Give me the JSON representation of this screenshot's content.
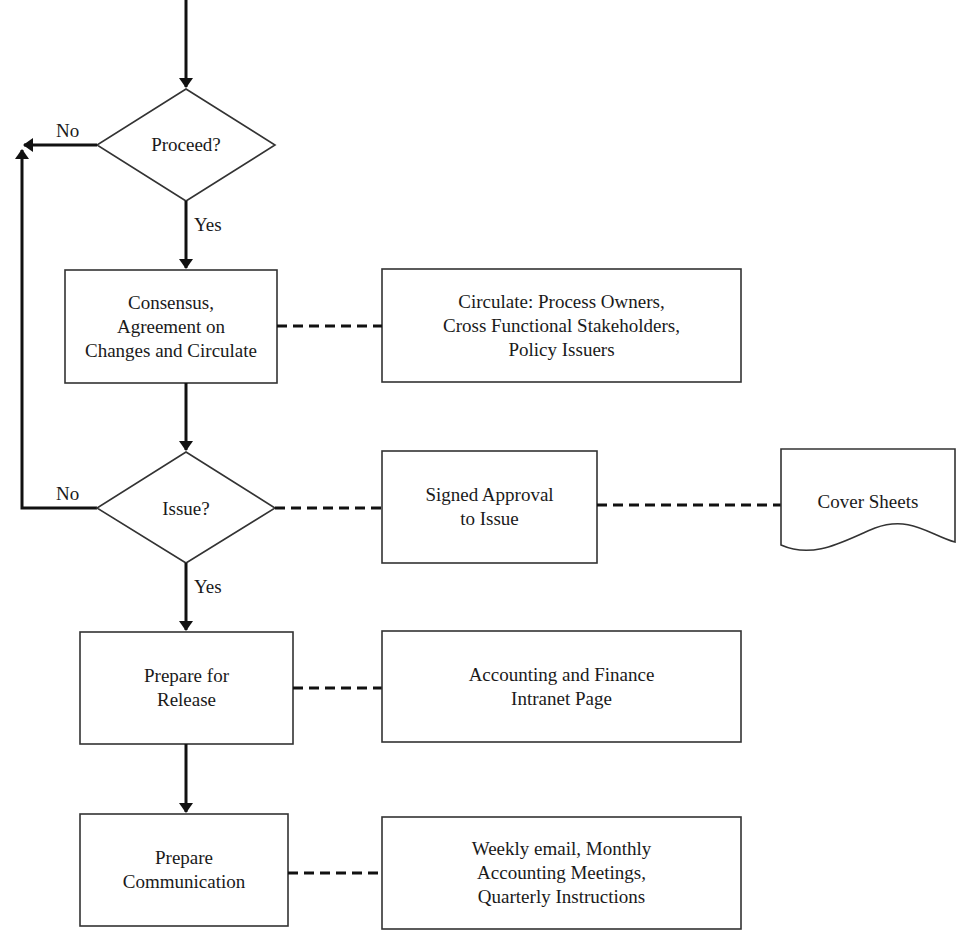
{
  "diagram": {
    "type": "flowchart",
    "nodes": [
      {
        "id": "proceed",
        "shape": "diamond",
        "label": "Proceed?"
      },
      {
        "id": "consensus",
        "shape": "process",
        "label": "Consensus,\nAgreement on\nChanges and Circulate"
      },
      {
        "id": "circulate",
        "shape": "process",
        "label": "Circulate: Process Owners,\nCross Functional Stakeholders,\nPolicy Issuers"
      },
      {
        "id": "issue",
        "shape": "diamond",
        "label": "Issue?"
      },
      {
        "id": "signed_approval",
        "shape": "process",
        "label": "Signed Approval\nto Issue"
      },
      {
        "id": "cover_sheets",
        "shape": "document",
        "label": "Cover Sheets"
      },
      {
        "id": "prepare_release",
        "shape": "process",
        "label": "Prepare for\nRelease"
      },
      {
        "id": "accounting_page",
        "shape": "process",
        "label": "Accounting and Finance\nIntranet Page"
      },
      {
        "id": "prepare_communication",
        "shape": "process",
        "label": "Prepare\nCommunication"
      },
      {
        "id": "weekly_email",
        "shape": "process",
        "label": "Weekly email, Monthly\nAccounting Meetings,\nQuarterly Instructions"
      }
    ],
    "edges": [
      {
        "from": "incoming",
        "to": "proceed",
        "style": "solid-arrow"
      },
      {
        "from": "proceed",
        "to": "consensus",
        "label": "Yes",
        "style": "solid-arrow"
      },
      {
        "from": "proceed",
        "to": "loop-left",
        "label": "No",
        "style": "solid-arrow"
      },
      {
        "from": "consensus",
        "to": "circulate",
        "style": "dashed"
      },
      {
        "from": "consensus",
        "to": "issue",
        "style": "solid-arrow"
      },
      {
        "from": "issue",
        "to": "loop-left",
        "label": "No",
        "style": "solid-arrow"
      },
      {
        "from": "issue",
        "to": "signed_approval",
        "style": "dashed"
      },
      {
        "from": "signed_approval",
        "to": "cover_sheets",
        "style": "dashed"
      },
      {
        "from": "issue",
        "to": "prepare_release",
        "label": "Yes",
        "style": "solid-arrow"
      },
      {
        "from": "prepare_release",
        "to": "accounting_page",
        "style": "dashed"
      },
      {
        "from": "prepare_release",
        "to": "prepare_communication",
        "style": "solid-arrow"
      },
      {
        "from": "prepare_communication",
        "to": "weekly_email",
        "style": "dashed"
      }
    ],
    "edge_labels": {
      "proceed_no": "No",
      "proceed_yes": "Yes",
      "issue_no": "No",
      "issue_yes": "Yes"
    }
  }
}
